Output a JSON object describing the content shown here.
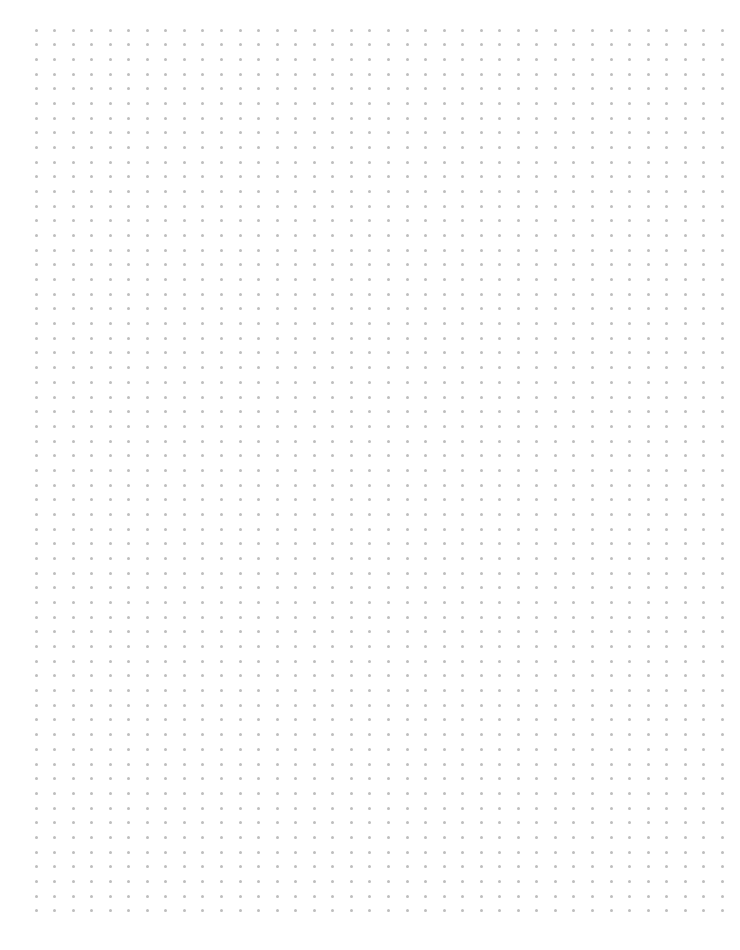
{
  "page": {
    "type": "dot-grid-paper",
    "background": "#ffffff",
    "dot_color": "#bdbdbd",
    "dot_size_px": 3,
    "origin_x": 36,
    "origin_y": 30,
    "spacing_x": 18.55,
    "spacing_y": 14.68,
    "columns": 38,
    "rows": 61
  }
}
